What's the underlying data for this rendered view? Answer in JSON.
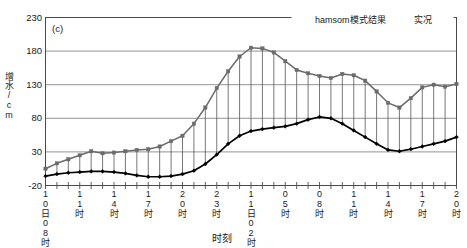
{
  "chart_data": {
    "type": "line",
    "title": "",
    "panel_label": "(c)",
    "xlabel": "时刻",
    "ylabel": "增水/cm",
    "ylim": [
      -20,
      230
    ],
    "yticks": [
      -20,
      30,
      80,
      130,
      180,
      230
    ],
    "grid": true,
    "grid_axis": "y",
    "legend_position": "top-right",
    "x_tick_labels": [
      "10日08时",
      "",
      "",
      "11时",
      "",
      "",
      "14时",
      "",
      "",
      "17时",
      "",
      "",
      "20时",
      "",
      "",
      "23时",
      "",
      "",
      "11日02时",
      "",
      "",
      "05时",
      "",
      "",
      "08时",
      "",
      "",
      "11时",
      "",
      "",
      "14时",
      "",
      "",
      "17时",
      "",
      "",
      "20时"
    ],
    "x": [
      "10日08时",
      "09时",
      "10时",
      "11时",
      "12时",
      "13时",
      "14时",
      "15时",
      "16时",
      "17时",
      "18时",
      "19时",
      "20时",
      "21时",
      "22时",
      "23时",
      "11日00时",
      "01时",
      "11日02时",
      "03时",
      "04时",
      "05时",
      "06时",
      "07时",
      "08时",
      "09时",
      "10时",
      "11时",
      "12时",
      "13时",
      "14时",
      "15时",
      "16时",
      "17时",
      "18时",
      "19时",
      "20时"
    ],
    "series": [
      {
        "name": "hamsom模式结果",
        "color": "#000000",
        "marker": "diamond",
        "values": [
          -6,
          -3,
          -1,
          0,
          1,
          1,
          0,
          -2,
          -5,
          -7,
          -7,
          -6,
          -3,
          2,
          12,
          26,
          42,
          54,
          61,
          64,
          66,
          68,
          72,
          78,
          82,
          80,
          72,
          62,
          52,
          42,
          33,
          31,
          34,
          38,
          42,
          46,
          52
        ]
      },
      {
        "name": "实况",
        "color": "#6b6b6b",
        "marker": "square",
        "values": [
          5,
          13,
          19,
          25,
          31,
          28,
          29,
          31,
          33,
          34,
          38,
          46,
          54,
          72,
          96,
          125,
          150,
          172,
          185,
          184,
          178,
          165,
          152,
          147,
          143,
          140,
          146,
          144,
          136,
          120,
          103,
          96,
          110,
          126,
          130,
          127,
          131
        ]
      }
    ],
    "dropline_note": "vertical lines connect the two series at each time step"
  },
  "legend": {
    "items": [
      {
        "label": "hamsom模式结果",
        "color": "#000000"
      },
      {
        "label": "实况",
        "color": "#6b6b6b"
      }
    ]
  }
}
